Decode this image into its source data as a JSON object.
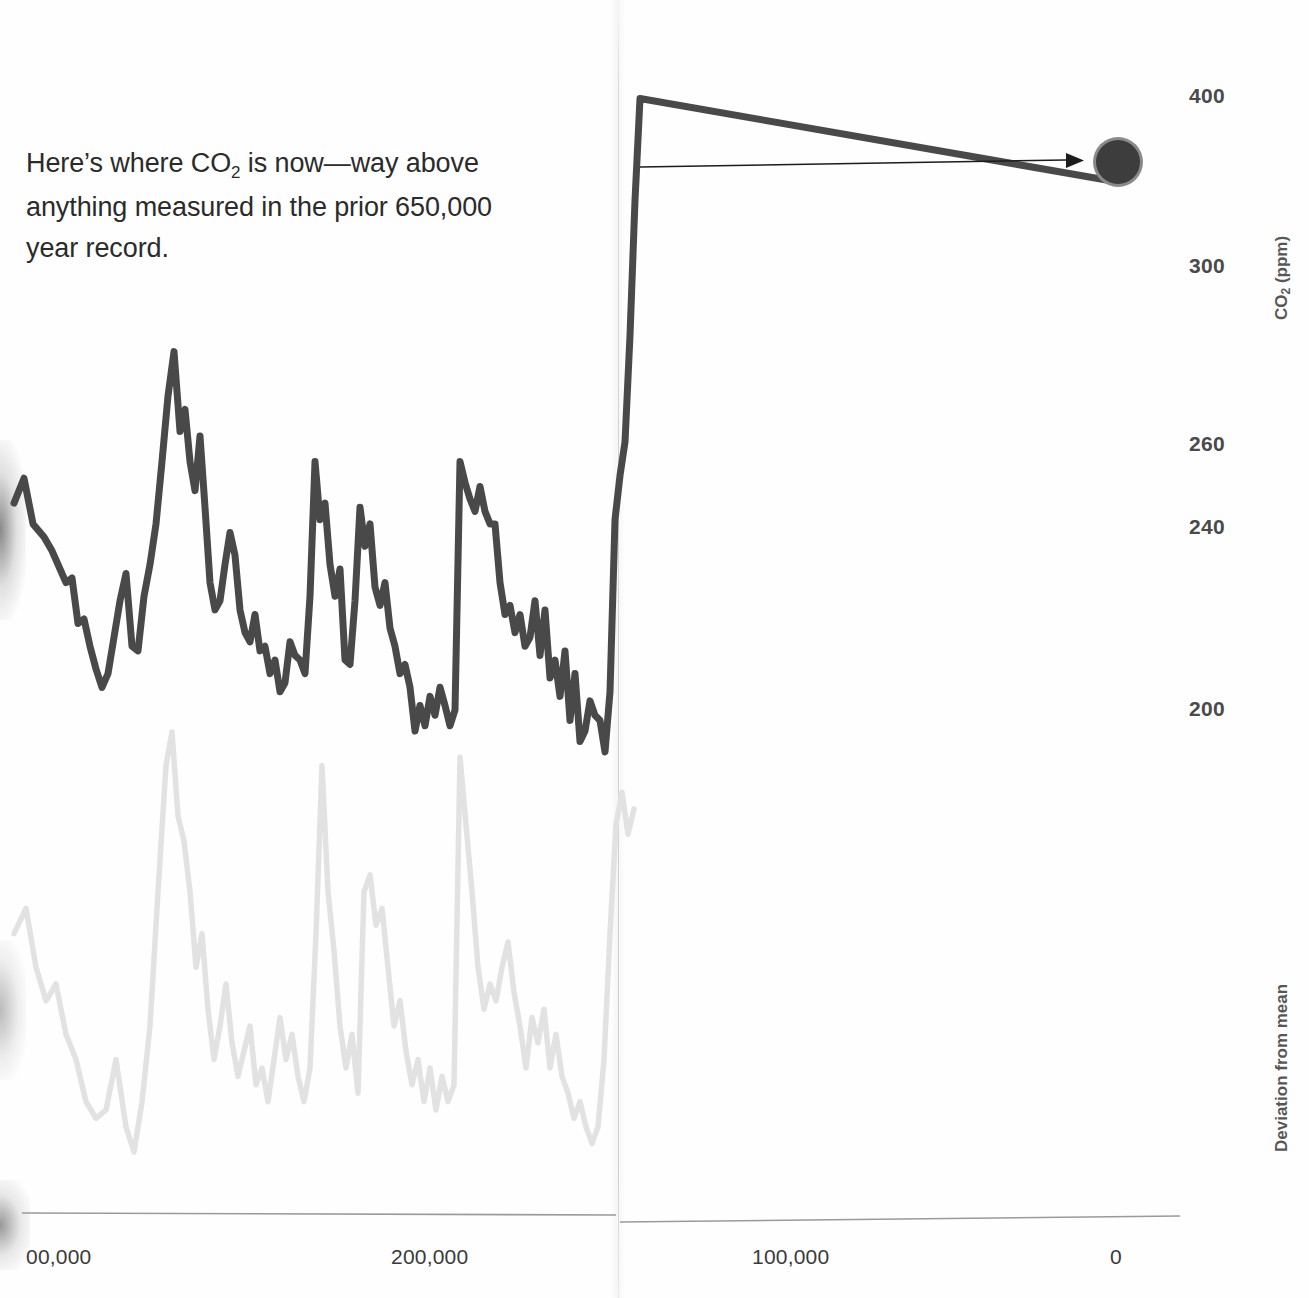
{
  "annotation": {
    "line1_pre": "Here’s where CO",
    "line1_sub": "2",
    "line1_post": " is now—way above",
    "line2": "anything measured in the prior 650,000",
    "line3": "year record."
  },
  "axes": {
    "y_title_pre": "CO",
    "y_title_sub": "2",
    "y_title_post": " (ppm)",
    "y2_title": "Deviation from mean",
    "y_ticks": [
      {
        "label": "400",
        "y": 97
      },
      {
        "label": "300",
        "y": 267
      },
      {
        "label": "260",
        "y": 445
      },
      {
        "label": "240",
        "y": 528
      },
      {
        "label": "200",
        "y": 710
      }
    ],
    "x_ticks": [
      {
        "label": "00,000",
        "x": 26
      },
      {
        "label": "200,000",
        "x": 391
      },
      {
        "label": "100,000",
        "x": 752
      },
      {
        "label": "0",
        "x": 1110
      }
    ]
  },
  "colors": {
    "co2_line": "#4a4a4a",
    "temp_line": "#e2e2e2",
    "marker_fill": "#3c3c3c",
    "marker_ring": "#8a8a8a",
    "arrow": "#1c1c1c",
    "axis": "#9a9a9a",
    "tick_text": "#3a3a3a",
    "annotation_text": "#2b2b2b"
  },
  "marker": {
    "cx": 1118,
    "cy": 162,
    "r": 22,
    "ring_r": 25
  },
  "arrow": {
    "x1": 640,
    "y1": 167,
    "x2": 1072,
    "y2": 160
  },
  "chart_data": {
    "type": "line",
    "title": "",
    "xlabel": "Years before present",
    "ylabel": "CO2 (ppm)",
    "ylabel_right": "Deviation from mean",
    "xlim": [
      410000,
      -8000
    ],
    "ylim": [
      180,
      410
    ],
    "grid": false,
    "legend_position": "none",
    "annotations": [
      {
        "text": "Here’s where CO2 is now—way above anything measured in the prior 650,000 year record.",
        "points_to": "modern_co2_marker"
      }
    ],
    "highlight_point": {
      "label": "modern CO2",
      "x": 0,
      "y": 400
    },
    "series": [
      {
        "name": "CO2 (ppm)",
        "color": "#4a4a4a",
        "units": "ppm",
        "points": [
          [
            -8,
            246
          ],
          [
            2,
            252
          ],
          [
            11,
            241
          ],
          [
            22,
            238
          ],
          [
            30,
            235
          ],
          [
            38,
            231
          ],
          [
            44,
            228
          ],
          [
            50,
            229
          ],
          [
            56,
            219
          ],
          [
            62,
            220
          ],
          [
            68,
            214
          ],
          [
            74,
            209
          ],
          [
            80,
            205
          ],
          [
            86,
            208
          ],
          [
            92,
            216
          ],
          [
            98,
            224
          ],
          [
            104,
            230
          ],
          [
            110,
            214
          ],
          [
            116,
            213
          ],
          [
            122,
            225
          ],
          [
            128,
            232
          ],
          [
            134,
            241
          ],
          [
            140,
            256
          ],
          [
            146,
            271
          ],
          [
            152,
            281
          ],
          [
            158,
            263
          ],
          [
            163,
            268
          ],
          [
            168,
            256
          ],
          [
            173,
            249
          ],
          [
            178,
            262
          ],
          [
            183,
            245
          ],
          [
            188,
            228
          ],
          [
            193,
            222
          ],
          [
            198,
            224
          ],
          [
            203,
            232
          ],
          [
            208,
            239
          ],
          [
            213,
            234
          ],
          [
            218,
            222
          ],
          [
            223,
            217
          ],
          [
            228,
            215
          ],
          [
            233,
            221
          ],
          [
            238,
            213
          ],
          [
            243,
            214
          ],
          [
            248,
            208
          ],
          [
            253,
            211
          ],
          [
            258,
            204
          ],
          [
            263,
            206
          ],
          [
            268,
            215
          ],
          [
            273,
            212
          ],
          [
            278,
            211
          ],
          [
            283,
            208
          ],
          [
            288,
            225
          ],
          [
            293,
            256
          ],
          [
            298,
            242
          ],
          [
            303,
            246
          ],
          [
            308,
            232
          ],
          [
            313,
            225
          ],
          [
            318,
            231
          ],
          [
            323,
            211
          ],
          [
            328,
            210
          ],
          [
            333,
            224
          ],
          [
            338,
            245
          ],
          [
            343,
            236
          ],
          [
            348,
            241
          ],
          [
            353,
            227
          ],
          [
            358,
            223
          ],
          [
            363,
            228
          ],
          [
            368,
            218
          ],
          [
            373,
            214
          ],
          [
            378,
            208
          ],
          [
            383,
            210
          ],
          [
            388,
            205
          ],
          [
            393,
            196
          ],
          [
            398,
            201
          ],
          [
            403,
            197
          ],
          [
            408,
            203
          ],
          [
            413,
            199
          ],
          [
            418,
            205
          ],
          [
            423,
            201
          ],
          [
            428,
            197
          ],
          [
            433,
            200
          ],
          [
            438,
            256
          ],
          [
            443,
            251
          ],
          [
            448,
            247
          ],
          [
            453,
            244
          ],
          [
            458,
            250
          ],
          [
            463,
            244
          ],
          [
            468,
            241
          ],
          [
            473,
            241
          ],
          [
            478,
            228
          ],
          [
            483,
            221
          ],
          [
            488,
            223
          ],
          [
            493,
            217
          ],
          [
            498,
            221
          ],
          [
            503,
            214
          ],
          [
            508,
            216
          ],
          [
            513,
            224
          ],
          [
            518,
            212
          ],
          [
            523,
            222
          ],
          [
            528,
            207
          ],
          [
            533,
            211
          ],
          [
            538,
            203
          ],
          [
            543,
            213
          ],
          [
            548,
            198
          ],
          [
            553,
            208
          ],
          [
            558,
            194
          ],
          [
            563,
            196
          ],
          [
            568,
            202
          ],
          [
            573,
            199
          ],
          [
            578,
            198
          ],
          [
            583,
            192
          ],
          [
            588,
            204
          ],
          [
            593,
            242
          ],
          [
            598,
            253
          ],
          [
            603,
            261
          ],
          [
            608,
            285
          ],
          [
            613,
            340
          ],
          [
            618,
            400
          ]
        ]
      },
      {
        "name": "Temperature deviation from mean",
        "color": "#e2e2e2",
        "units": "relative",
        "points": [
          [
            -8,
            0.52
          ],
          [
            4,
            0.58
          ],
          [
            14,
            0.44
          ],
          [
            24,
            0.36
          ],
          [
            34,
            0.4
          ],
          [
            44,
            0.28
          ],
          [
            54,
            0.22
          ],
          [
            64,
            0.12
          ],
          [
            74,
            0.08
          ],
          [
            84,
            0.1
          ],
          [
            94,
            0.22
          ],
          [
            104,
            0.06
          ],
          [
            112,
            0.0
          ],
          [
            120,
            0.12
          ],
          [
            128,
            0.3
          ],
          [
            136,
            0.62
          ],
          [
            144,
            0.92
          ],
          [
            150,
            1.0
          ],
          [
            156,
            0.8
          ],
          [
            162,
            0.74
          ],
          [
            168,
            0.62
          ],
          [
            174,
            0.44
          ],
          [
            180,
            0.52
          ],
          [
            186,
            0.34
          ],
          [
            192,
            0.22
          ],
          [
            198,
            0.3
          ],
          [
            204,
            0.4
          ],
          [
            210,
            0.26
          ],
          [
            216,
            0.18
          ],
          [
            222,
            0.24
          ],
          [
            228,
            0.3
          ],
          [
            234,
            0.16
          ],
          [
            240,
            0.2
          ],
          [
            246,
            0.12
          ],
          [
            252,
            0.22
          ],
          [
            258,
            0.32
          ],
          [
            264,
            0.22
          ],
          [
            270,
            0.28
          ],
          [
            276,
            0.18
          ],
          [
            282,
            0.12
          ],
          [
            288,
            0.2
          ],
          [
            294,
            0.52
          ],
          [
            300,
            0.92
          ],
          [
            306,
            0.62
          ],
          [
            312,
            0.48
          ],
          [
            318,
            0.3
          ],
          [
            324,
            0.2
          ],
          [
            330,
            0.28
          ],
          [
            336,
            0.14
          ],
          [
            342,
            0.62
          ],
          [
            348,
            0.66
          ],
          [
            354,
            0.54
          ],
          [
            360,
            0.58
          ],
          [
            366,
            0.44
          ],
          [
            372,
            0.3
          ],
          [
            378,
            0.36
          ],
          [
            384,
            0.24
          ],
          [
            390,
            0.16
          ],
          [
            396,
            0.22
          ],
          [
            402,
            0.12
          ],
          [
            408,
            0.2
          ],
          [
            414,
            0.1
          ],
          [
            420,
            0.18
          ],
          [
            426,
            0.12
          ],
          [
            432,
            0.16
          ],
          [
            438,
            0.94
          ],
          [
            444,
            0.78
          ],
          [
            450,
            0.62
          ],
          [
            456,
            0.44
          ],
          [
            462,
            0.34
          ],
          [
            468,
            0.4
          ],
          [
            474,
            0.36
          ],
          [
            480,
            0.44
          ],
          [
            486,
            0.5
          ],
          [
            492,
            0.38
          ],
          [
            498,
            0.3
          ],
          [
            504,
            0.2
          ],
          [
            510,
            0.32
          ],
          [
            516,
            0.26
          ],
          [
            522,
            0.34
          ],
          [
            528,
            0.2
          ],
          [
            534,
            0.28
          ],
          [
            540,
            0.18
          ],
          [
            546,
            0.14
          ],
          [
            552,
            0.08
          ],
          [
            558,
            0.12
          ],
          [
            564,
            0.06
          ],
          [
            570,
            0.02
          ],
          [
            576,
            0.06
          ],
          [
            582,
            0.22
          ],
          [
            588,
            0.52
          ],
          [
            594,
            0.78
          ],
          [
            600,
            0.86
          ],
          [
            606,
            0.76
          ],
          [
            612,
            0.82
          ]
        ]
      }
    ]
  }
}
